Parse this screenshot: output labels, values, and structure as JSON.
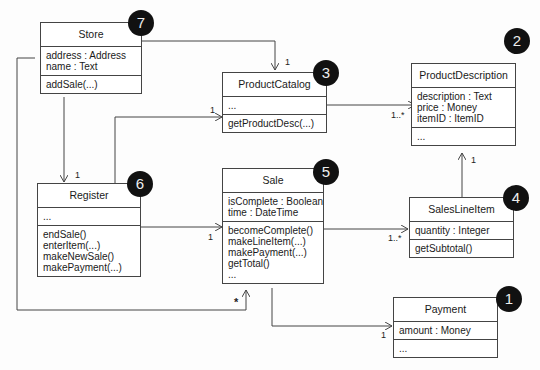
{
  "classes": {
    "store": {
      "name": "Store",
      "badge": "7",
      "attributes": [
        "address : Address",
        "name : Text"
      ],
      "operations": [
        "addSale(...)"
      ]
    },
    "product_catalog": {
      "name": "ProductCatalog",
      "badge": "3",
      "attributes": [
        "..."
      ],
      "operations": [
        "getProductDesc(...)"
      ]
    },
    "product_description": {
      "name": "ProductDescription",
      "badge": "2",
      "attributes": [
        "description : Text",
        "price : Money",
        "itemID : ItemID"
      ],
      "operations": [
        "..."
      ]
    },
    "register": {
      "name": "Register",
      "badge": "6",
      "attributes": [
        "..."
      ],
      "operations": [
        "endSale()",
        "enterItem(...)",
        "makeNewSale()",
        "makePayment(...)"
      ]
    },
    "sale": {
      "name": "Sale",
      "badge": "5",
      "attributes": [
        "isComplete : Boolean",
        "time : DateTime"
      ],
      "operations": [
        "becomeComplete()",
        "makeLineItem(...)",
        "makePayment(...)",
        "getTotal()",
        "..."
      ]
    },
    "sales_line_item": {
      "name": "SalesLineItem",
      "badge": "4",
      "attributes": [
        "quantity : Integer"
      ],
      "operations": [
        "getSubtotal()"
      ]
    },
    "payment": {
      "name": "Payment",
      "badge": "1",
      "attributes": [
        "amount : Money"
      ],
      "operations": [
        "..."
      ]
    }
  },
  "multiplicities": {
    "store_catalog": "1",
    "register_catalog": "1",
    "catalog_desc": "1..*",
    "store_register": "1",
    "register_sale": "1",
    "store_sale": "*",
    "sale_lineitem": "1..*",
    "lineitem_desc": "1",
    "sale_payment": "1"
  }
}
